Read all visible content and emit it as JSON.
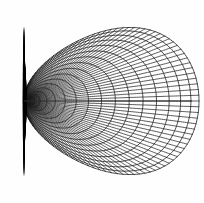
{
  "figure": {
    "type": "line-drawing",
    "canvas": {
      "width": 204,
      "height": 203
    },
    "background_color": "#fefefe",
    "stroke_color": "#1a1a1a",
    "blade_color": "#000000",
    "axis_color": "#2b2b2b",
    "focus": {
      "x": 24,
      "y": 101
    },
    "net_bounds": {
      "left": 22,
      "right": 192,
      "top": 13,
      "bottom": 190
    },
    "geometry": {
      "description": "Apple-shaped orthogonal net: family of nested closed ring curves and a dense fan of radial meridian curves, all passing through a single cusp focus at the left.",
      "ring_count": 17,
      "meridian_count": 49,
      "ring_max_radius": 88.5,
      "ring_min_radius": 3.0,
      "ring_vertical_scale": 1.0,
      "center": {
        "x": 110.5,
        "y": 101
      },
      "cusp_pinch": 0.965,
      "ring_radii": [
        3.0,
        5.2,
        8.0,
        11.6,
        15.8,
        20.8,
        26.4,
        32.6,
        39.2,
        46.2,
        53.2,
        60.2,
        67.0,
        73.4,
        79.2,
        84.4,
        88.5
      ],
      "meridian_angles_deg": [
        0,
        3.75,
        7.5,
        11.25,
        15,
        18.75,
        22.5,
        26.25,
        30,
        33.75,
        37.5,
        41.25,
        45,
        48.75,
        52.5,
        56.25,
        60,
        63.75,
        67.5,
        71.25,
        75,
        78.75,
        82.5,
        86.25,
        90,
        93.75,
        97.5,
        101.25,
        105,
        108.75,
        112.5,
        116.25,
        120,
        123.75,
        127.5,
        131.25,
        135,
        138.75,
        142.5,
        146.25,
        150,
        153.75,
        157.5,
        161.25,
        165,
        168.75,
        172.5,
        176.25,
        180
      ],
      "axis_line": {
        "y": 101,
        "x_start": 24,
        "x_end": 192
      }
    },
    "blade": {
      "description": "Dense dark vertical fan of meridian tails at the focus",
      "x": 24,
      "top": 28,
      "bottom": 175,
      "half_width": 5,
      "spike_count": 64
    },
    "stroke_widths": {
      "ring": 0.85,
      "meridian": 0.8,
      "axis": 1.0,
      "blade": 0.7
    }
  }
}
